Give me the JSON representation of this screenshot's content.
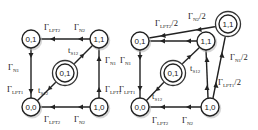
{
  "diagrams": [
    {
      "nodes": [
        {
          "id": "s01",
          "label": "0,1",
          "x": 31,
          "y": 39,
          "double": false
        },
        {
          "id": "s11",
          "label": "1,1",
          "x": 99,
          "y": 39,
          "double": false
        },
        {
          "id": "s00",
          "label": "0,0",
          "x": 31,
          "y": 107,
          "double": false
        },
        {
          "id": "s10",
          "label": "1,0",
          "x": 99,
          "y": 107,
          "double": false
        },
        {
          "id": "c01",
          "label": "0,1",
          "x": 65,
          "y": 73,
          "double": true
        }
      ],
      "labels": [
        {
          "base": "Γ",
          "sub": "LPT2",
          "suffix": "",
          "x": 44,
          "y": 30
        },
        {
          "base": "Γ",
          "sub": "N2",
          "suffix": "",
          "x": 74,
          "y": 30
        },
        {
          "base": "Γ",
          "sub": "N1",
          "suffix": "",
          "x": 8,
          "y": 70
        },
        {
          "base": "Γ",
          "sub": "LPT1",
          "suffix": "",
          "x": 7,
          "y": 92
        },
        {
          "base": "t",
          "sub": "S12",
          "suffix": "",
          "x": 68,
          "y": 53
        },
        {
          "base": "t",
          "sub": "S12",
          "suffix": "",
          "x": 38,
          "y": 93
        },
        {
          "base": "Γ",
          "sub": "N1",
          "suffix": "",
          "x": 105,
          "y": 63
        },
        {
          "base": "Γ",
          "sub": "LPT1",
          "suffix": "",
          "x": 105,
          "y": 92
        },
        {
          "base": "Γ",
          "sub": "LPT2",
          "suffix": "",
          "x": 44,
          "y": 122
        },
        {
          "base": "Γ",
          "sub": "N2",
          "suffix": "",
          "x": 74,
          "y": 122
        }
      ]
    },
    {
      "nodes": [
        {
          "id": "s01",
          "label": "0,1",
          "x": 140,
          "y": 41,
          "double": false
        },
        {
          "id": "s11",
          "label": "1,1",
          "x": 206,
          "y": 41,
          "double": false
        },
        {
          "id": "s11b",
          "label": "1,1",
          "x": 228,
          "y": 24,
          "double": true
        },
        {
          "id": "s00",
          "label": "0,0",
          "x": 140,
          "y": 107,
          "double": false
        },
        {
          "id": "s10",
          "label": "1,0",
          "x": 210,
          "y": 107,
          "double": false
        },
        {
          "id": "c01",
          "label": "0,1",
          "x": 173,
          "y": 73,
          "double": true
        }
      ],
      "labels": [
        {
          "base": "Γ",
          "sub": "LPT2",
          "suffix": "/2",
          "x": 155,
          "y": 26
        },
        {
          "base": "Γ",
          "sub": "N2",
          "suffix": "/2",
          "x": 188,
          "y": 19
        },
        {
          "base": "Γ",
          "sub": "N1",
          "suffix": "/2",
          "x": 230,
          "y": 60
        },
        {
          "base": "Γ",
          "sub": "LPT1",
          "suffix": "/2",
          "x": 218,
          "y": 85
        },
        {
          "base": "t",
          "sub": "S12",
          "suffix": "",
          "x": 190,
          "y": 71
        },
        {
          "base": "t",
          "sub": "S12",
          "suffix": "",
          "x": 152,
          "y": 99
        },
        {
          "base": "Γ",
          "sub": "N1",
          "suffix": "",
          "x": 120,
          "y": 63
        },
        {
          "base": "Γ",
          "sub": "LPT1",
          "suffix": "",
          "x": 119,
          "y": 92
        },
        {
          "base": "Γ",
          "sub": "LPT2",
          "suffix": "",
          "x": 152,
          "y": 123
        },
        {
          "base": "Γ",
          "sub": "N2",
          "suffix": "",
          "x": 182,
          "y": 123
        }
      ]
    }
  ]
}
